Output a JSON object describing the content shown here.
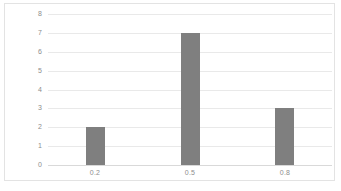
{
  "chart_data": {
    "type": "bar",
    "title": "",
    "subtitle": "",
    "xlabel": "",
    "ylabel": "",
    "categories": [
      "0.2",
      "0.5",
      "0.8"
    ],
    "values": [
      2,
      7,
      3
    ],
    "series": [
      {
        "name": "",
        "values": [
          2,
          7,
          3
        ]
      }
    ],
    "ylim": [
      0,
      8
    ],
    "y_ticks": [
      "0",
      "1",
      "2",
      "3",
      "4",
      "5",
      "6",
      "7",
      "8"
    ],
    "y_ticks_desc": [
      "8",
      "7",
      "6",
      "5",
      "4",
      "3",
      "2",
      "1",
      "0"
    ],
    "grid": "horizontal",
    "legend": "none",
    "colors": {
      "bar": "#7f7f7f",
      "gridline": "#e9e9e9",
      "baseline": "#d9d9d9",
      "frame": "#e3e3e3",
      "tick_label": "#8d8d8d",
      "background": "#ffffff"
    }
  }
}
